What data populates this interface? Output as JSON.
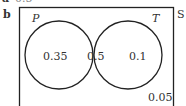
{
  "prev_part": {
    "label": "a",
    "value": "0.5"
  },
  "part": {
    "label": "b"
  },
  "venn": {
    "universe_label": "S",
    "sets": [
      {
        "name": "P"
      },
      {
        "name": "T"
      }
    ],
    "regions": {
      "p_only": "0.35",
      "both": "0.5",
      "t_only": "0.1",
      "outside": "0.05"
    }
  }
}
